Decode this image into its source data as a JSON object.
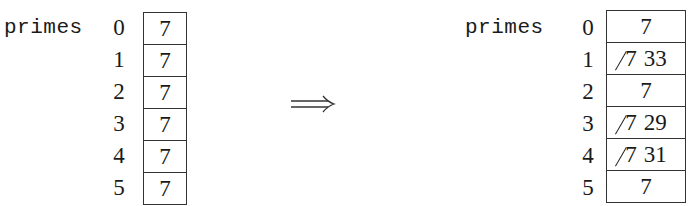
{
  "before": {
    "label": "primes",
    "indices": [
      "0",
      "1",
      "2",
      "3",
      "4",
      "5"
    ],
    "cells": [
      {
        "old": "",
        "value": "7"
      },
      {
        "old": "",
        "value": "7"
      },
      {
        "old": "",
        "value": "7"
      },
      {
        "old": "",
        "value": "7"
      },
      {
        "old": "",
        "value": "7"
      },
      {
        "old": "",
        "value": "7"
      }
    ]
  },
  "transition": {
    "symbol": "⟹",
    "icon": "double-right-arrow-icon"
  },
  "after": {
    "label": "primes",
    "indices": [
      "0",
      "1",
      "2",
      "3",
      "4",
      "5"
    ],
    "cells": [
      {
        "old": "",
        "value": "7"
      },
      {
        "old": "7",
        "value": "33"
      },
      {
        "old": "",
        "value": "7"
      },
      {
        "old": "7",
        "value": "29"
      },
      {
        "old": "7",
        "value": "31"
      },
      {
        "old": "",
        "value": "7"
      }
    ]
  }
}
